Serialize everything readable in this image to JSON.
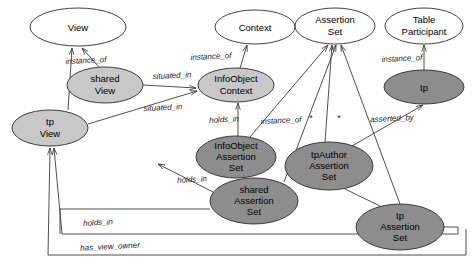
{
  "diagram": {
    "colors": {
      "white_fill": "#ffffff",
      "light_gray_fill": "#c8c8c8",
      "dark_gray_fill": "#8d8d8d",
      "stroke": "#2b2b2b",
      "line": "#3a3a3a",
      "text": "#000000"
    },
    "nodes": [
      {
        "id": "view",
        "label": "View",
        "line1": "View",
        "line2": "",
        "cx": 78,
        "cy": 27,
        "rx": 48,
        "ry": 19,
        "fill": "white_fill"
      },
      {
        "id": "context",
        "label": "Context",
        "line1": "Context",
        "line2": "",
        "cx": 255,
        "cy": 27,
        "rx": 40,
        "ry": 17,
        "fill": "white_fill"
      },
      {
        "id": "assertion-set",
        "label": "Assertion Set",
        "line1": "Assertion",
        "line2": "Set",
        "cx": 335,
        "cy": 26,
        "rx": 40,
        "ry": 18,
        "fill": "white_fill"
      },
      {
        "id": "table-participant",
        "label": "Table Participant",
        "line1": "Table",
        "line2": "Participant",
        "cx": 424,
        "cy": 26,
        "rx": 39,
        "ry": 18,
        "fill": "white_fill"
      },
      {
        "id": "shared-view",
        "label": "shared View",
        "line1": "shared",
        "line2": "View",
        "cx": 105,
        "cy": 85,
        "rx": 38,
        "ry": 18,
        "fill": "light_gray_fill"
      },
      {
        "id": "infoobject-context",
        "label": "InfoObject Context",
        "line1": "InfoObject",
        "line2": "Context",
        "cx": 236,
        "cy": 85,
        "rx": 38,
        "ry": 17,
        "fill": "light_gray_fill"
      },
      {
        "id": "tp",
        "label": "tp",
        "line1": "tp",
        "line2": "",
        "cx": 424,
        "cy": 87,
        "rx": 40,
        "ry": 17,
        "fill": "dark_gray_fill"
      },
      {
        "id": "tp-view",
        "label": "tp View",
        "line1": "tp",
        "line2": "View",
        "cx": 50,
        "cy": 128,
        "rx": 38,
        "ry": 18,
        "fill": "light_gray_fill"
      },
      {
        "id": "infoobject-assertion-set",
        "label": "InfoObject Assertion Set",
        "line1": "InfoObject",
        "line2": "Assertion Set",
        "cx": 236,
        "cy": 157,
        "rx": 40,
        "ry": 21,
        "fill": "dark_gray_fill"
      },
      {
        "id": "tpauthor-assertion-set",
        "label": "tpAuthor Assertion Set",
        "line1": "tpAuthor",
        "line2": "Assertion Set",
        "cx": 329,
        "cy": 166,
        "rx": 44,
        "ry": 24,
        "fill": "dark_gray_fill"
      },
      {
        "id": "shared-assertion-set",
        "label": "shared Assertion Set",
        "line1": "shared",
        "line2": "Assertion Set",
        "cx": 254,
        "cy": 201,
        "rx": 44,
        "ry": 23,
        "fill": "dark_gray_fill"
      },
      {
        "id": "tp-assertion-set",
        "label": "tp Assertion Set",
        "line1": "tp",
        "line2": "Assertion Set",
        "cx": 400,
        "cy": 227,
        "rx": 44,
        "ry": 23,
        "fill": "dark_gray_fill"
      }
    ],
    "edges": [
      {
        "id": "shared-view-instance-of-view",
        "label": "instance_of",
        "lx": 86,
        "ly": 61
      },
      {
        "id": "shared-view-situated-in-infoobject-context",
        "label": "situated_in",
        "lx": 172,
        "ly": 76
      },
      {
        "id": "tp-view-situated-in-infoobject-context",
        "label": "situated_in",
        "lx": 163,
        "ly": 108
      },
      {
        "id": "infoobject-context-instance-of-context",
        "label": "instance_of",
        "lx": 211,
        "ly": 57
      },
      {
        "id": "infoobject-context-holds-in",
        "label": "holds_in",
        "lx": 224,
        "ly": 120
      },
      {
        "id": "infoobject-assertion-set-instance-of",
        "label": "instance_of",
        "lx": 281,
        "ly": 121
      },
      {
        "id": "tp-instance-of-table-participant",
        "label": "instance_of",
        "lx": 402,
        "ly": 59
      },
      {
        "id": "tp-asserted-by",
        "label": "asserted_by",
        "lx": 392,
        "ly": 119
      },
      {
        "id": "shared-assertion-set-holds-in",
        "label": "holds_in",
        "lx": 192,
        "ly": 180
      },
      {
        "id": "tp-assertion-set-holds-in",
        "label": "holds_in",
        "lx": 98,
        "ly": 223
      },
      {
        "id": "tp-assertion-set-has-view-owner",
        "label": "has_view_owner",
        "lx": 110,
        "ly": 247
      }
    ],
    "multiplicities": [
      {
        "id": "mult-tpauthor",
        "label": "*",
        "lx": 311,
        "ly": 119
      },
      {
        "id": "mult-sharedset",
        "label": "*",
        "lx": 339,
        "ly": 119
      }
    ]
  }
}
